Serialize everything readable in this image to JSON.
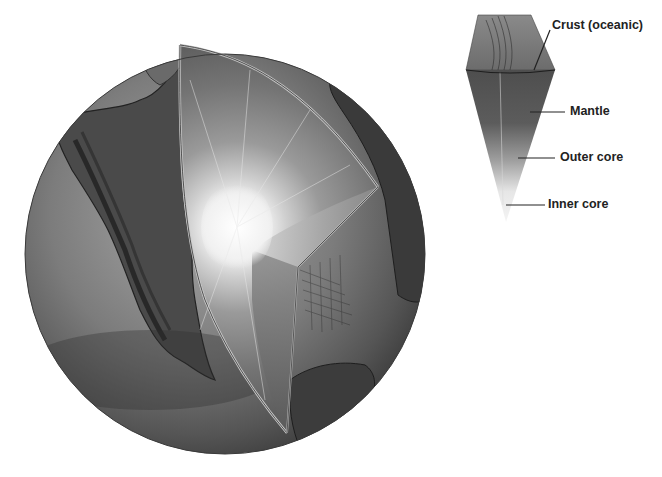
{
  "figure": {
    "main_illustration": "globe-with-wedge-cutaway",
    "inset_illustration": "layer-wedge"
  },
  "labels": [
    {
      "id": "crust",
      "text": "Crust (oceanic)"
    },
    {
      "id": "mantle",
      "text": "Mantle"
    },
    {
      "id": "outer_core",
      "text": "Outer core"
    },
    {
      "id": "inner_core",
      "text": "Inner core"
    }
  ],
  "colors": {
    "background": "#ffffff",
    "ocean": "#7a7a7a",
    "land": "#4a4a4a",
    "mantle": "#6e6e6e",
    "core_glow": "#f4f4f4",
    "label_text": "#222222",
    "leader_line": "#222222"
  }
}
